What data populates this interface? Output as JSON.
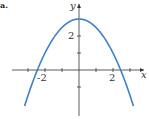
{
  "part_label": "a.",
  "chart_data": {
    "type": "line",
    "title": "",
    "function": "y = 3 - 0.5x^2",
    "xlabel": "x",
    "ylabel": "y",
    "x_tick_labels": [
      "-2",
      "2"
    ],
    "y_tick_labels": [
      "2"
    ],
    "xlim": [
      -4.5,
      4
    ],
    "ylim": [
      -2.9,
      4.1
    ],
    "grid": false,
    "series": [
      {
        "name": "parabola",
        "color": "#3b82c4",
        "x": [
          -3.2,
          -3.0,
          -2.5,
          -2.0,
          -1.5,
          -1.0,
          -0.5,
          0,
          0.5,
          1.0,
          1.5,
          2.0,
          2.5,
          3.0,
          3.2
        ],
        "y": [
          -2.12,
          -1.5,
          -0.125,
          1.0,
          1.875,
          2.5,
          2.875,
          3.0,
          2.875,
          2.5,
          1.875,
          1.0,
          -0.125,
          -1.5,
          -2.12
        ]
      }
    ]
  },
  "style": {
    "axis_color": "#333333",
    "curve_color": "#3b82c4"
  }
}
